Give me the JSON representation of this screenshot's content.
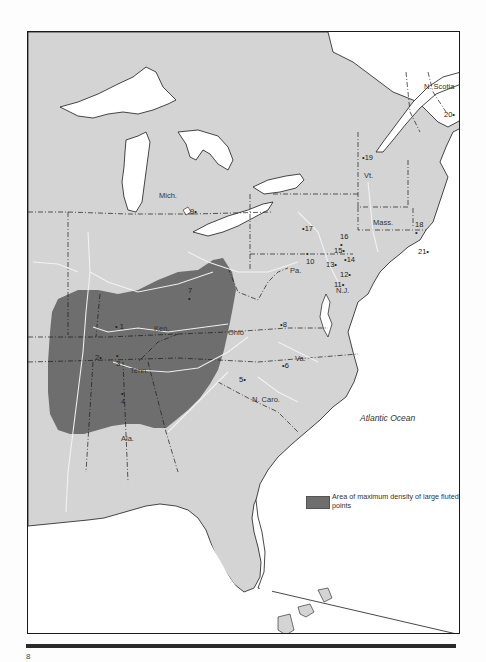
{
  "map": {
    "title": "",
    "ocean_label": "Atlantic Ocean",
    "colors": {
      "land": "#d4d4d4",
      "water": "#ffffff",
      "density_area": "#6e6e6e",
      "borders": "#1a1a1a",
      "rivers": "#f4f4f4"
    },
    "region_labels": [
      {
        "id": "n-scotia",
        "text": "N. Scotia"
      },
      {
        "id": "vt",
        "text": "Vt."
      },
      {
        "id": "mass",
        "text": "Mass."
      },
      {
        "id": "mich",
        "text": "Mich."
      },
      {
        "id": "pa",
        "text": "Pa."
      },
      {
        "id": "nj",
        "text": "N.J."
      },
      {
        "id": "ohio",
        "text": "Ohio"
      },
      {
        "id": "ken",
        "text": "Ken."
      },
      {
        "id": "va",
        "text": "Va."
      },
      {
        "id": "tenn",
        "text": "Tenn."
      },
      {
        "id": "n-caro",
        "text": "N. Caro."
      },
      {
        "id": "ala",
        "text": "Ala."
      }
    ],
    "sites": [
      {
        "num": "1"
      },
      {
        "num": "2"
      },
      {
        "num": "3"
      },
      {
        "num": "4"
      },
      {
        "num": "5"
      },
      {
        "num": "6"
      },
      {
        "num": "7"
      },
      {
        "num": "8"
      },
      {
        "num": "9"
      },
      {
        "num": "10"
      },
      {
        "num": "11"
      },
      {
        "num": "12"
      },
      {
        "num": "13"
      },
      {
        "num": "14"
      },
      {
        "num": "15"
      },
      {
        "num": "16"
      },
      {
        "num": "17"
      },
      {
        "num": "18"
      },
      {
        "num": "19"
      },
      {
        "num": "20"
      },
      {
        "num": "21"
      }
    ],
    "legend": {
      "label": "Area of maximum density of large fluted points"
    }
  },
  "page": {
    "number": "8"
  }
}
